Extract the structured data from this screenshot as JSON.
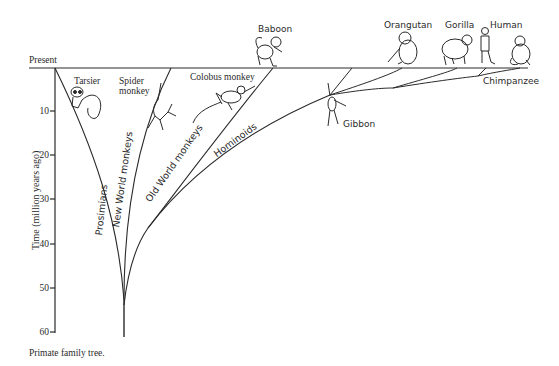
{
  "title": "Primate family tree",
  "caption": "Primate family tree.",
  "axis": {
    "top_label": "Present",
    "y_title": "Time (million years ago)",
    "ticks": [
      "10",
      "20",
      "30",
      "40",
      "50",
      "60"
    ]
  },
  "branches": {
    "prosimians": "Prosimians",
    "new_world": "New World monkeys",
    "old_world": "Old World monkeys",
    "hominoids": "Hominoids"
  },
  "species": {
    "tarsier": "Tarsier",
    "spider_monkey_1": "Spider",
    "spider_monkey_2": "monkey",
    "colobus": "Colobus monkey",
    "baboon": "Baboon",
    "gibbon": "Gibbon",
    "orangutan": "Orangutan",
    "gorilla": "Gorilla",
    "human": "Human",
    "chimpanzee": "Chimpanzee"
  },
  "colors": {
    "ink": "#2a2a2a",
    "background": "#ffffff"
  }
}
